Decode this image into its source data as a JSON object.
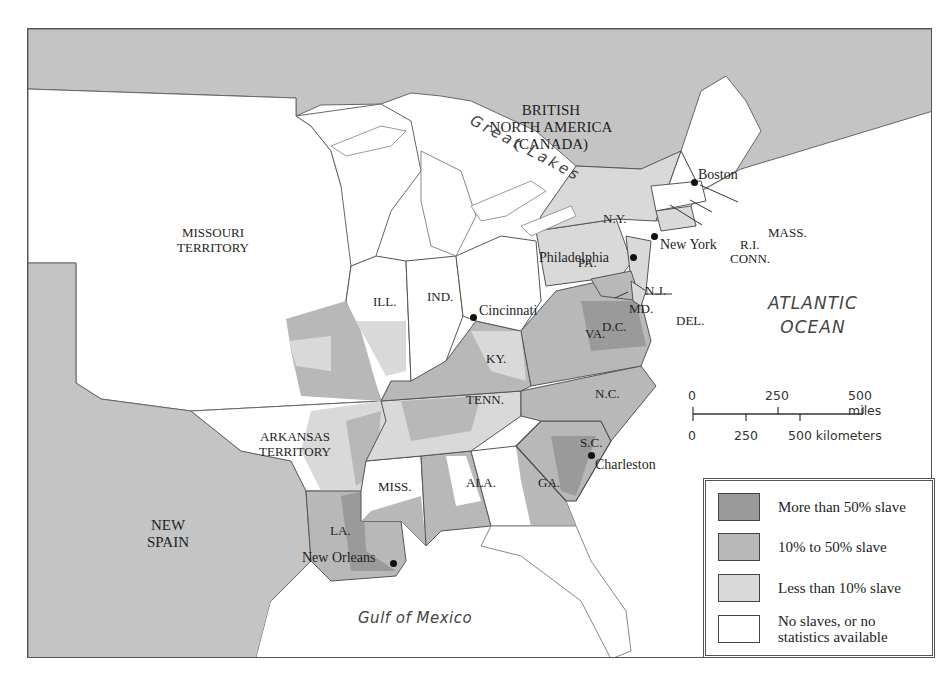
{
  "map": {
    "type": "thematic choropleth map",
    "regions": {
      "canada": "BRITISH\nNORTH AMERICA\n(CANADA)",
      "missouri_territory": "MISSOURI\nTERRITORY",
      "arkansas_territory": "ARKANSAS\nTERRITORY",
      "new_spain": "NEW\nSPAIN"
    },
    "water": {
      "great_lakes": "Great Lakes",
      "atlantic_line1": "ATLANTIC",
      "atlantic_line2": "OCEAN",
      "gulf": "Gulf of Mexico"
    },
    "states": {
      "ny": "N.Y.",
      "pa": "PA.",
      "nj": "N.J.",
      "md": "MD.",
      "dc": "D.C.",
      "del": "DEL.",
      "mass": "MASS.",
      "ri": "R.I.",
      "conn": "CONN.",
      "ill": "ILL.",
      "ind": "IND.",
      "va": "VA.",
      "ky": "KY.",
      "nc": "N.C.",
      "tenn": "TENN.",
      "sc": "S.C.",
      "ga": "GA.",
      "ala": "ALA.",
      "miss": "MISS.",
      "la": "LA."
    },
    "cities": {
      "boston": "Boston",
      "new_york": "New York",
      "philadelphia": "Philadelphia",
      "cincinnati": "Cincinnati",
      "charleston": "Charleston",
      "new_orleans": "New Orleans"
    }
  },
  "scale_bar": {
    "miles": [
      "0",
      "250",
      "500 miles"
    ],
    "kilometers": [
      "0",
      "250",
      "500 kilometers"
    ]
  },
  "legend": {
    "items": [
      {
        "label": "More than 50% slave",
        "color": "#9a9a9a"
      },
      {
        "label": "10% to 50% slave",
        "color": "#b8b8b8"
      },
      {
        "label": "Less than 10% slave",
        "color": "#d9d9d9"
      },
      {
        "label": "No slaves, or no\nstatistics available",
        "color": "#ffffff"
      }
    ]
  },
  "colors": {
    "foreign_land": "#c4c4c4",
    "water": "#ffffff",
    "border": "#555555"
  }
}
